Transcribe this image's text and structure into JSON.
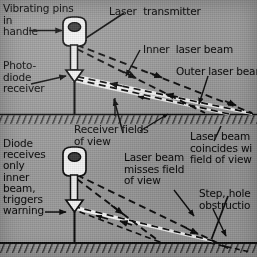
{
  "figure": {
    "panels": [
      {
        "id": "top-panel",
        "name": "clear-path-panel",
        "labels": [
          {
            "name": "vibrating-pins-label",
            "text": "Vibrating pins\nin\nhandle"
          },
          {
            "name": "photodiode-receiver-label",
            "text": "Photo-\ndiode\nreceiver"
          },
          {
            "name": "laser-transmitter-label",
            "text": "Laser  transmitter"
          },
          {
            "name": "inner-laser-beam-label",
            "text": "Inner  laser beam"
          },
          {
            "name": "outer-laser-beam-label",
            "text": "Outer laser bear"
          },
          {
            "name": "receiver-fields-of-view-label",
            "text": "Receiver fields\nof view"
          }
        ]
      },
      {
        "id": "bottom-panel",
        "name": "obstruction-detected-panel",
        "labels": [
          {
            "name": "diode-warning-label",
            "text": "Diode\nreceives\nonly\ninner\nbeam,\ntriggers\nwarning"
          },
          {
            "name": "laser-beam-misses-label",
            "text": "Laser beam\nmisses field\nof view"
          },
          {
            "name": "laser-beam-coincides-label",
            "text": "Laser beam\ncoincides wi\nfield of view"
          },
          {
            "name": "step-hole-obstruction-label",
            "text": "Step, hole\nobstructio"
          }
        ]
      }
    ],
    "device": {
      "name": "laser-cane",
      "parts": [
        "handle",
        "shaft",
        "photodiode-receiver",
        "tip"
      ]
    },
    "beams": {
      "inner_laser_beam": "dashed",
      "outer_laser_beam": "dashed",
      "receiver_field_of_view": "white-band"
    },
    "colors": {
      "paper": "#9a9a9a",
      "ink": "#111111",
      "field_of_view": "#f2f2f2",
      "ground": "#141414"
    }
  }
}
